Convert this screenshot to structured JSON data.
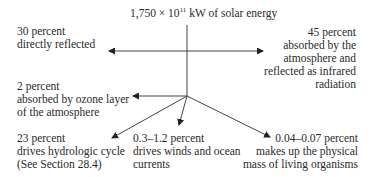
{
  "title": {
    "prefix": "1,750 × 10",
    "exponent": "11",
    "suffix": " kW of solar energy"
  },
  "labels": {
    "reflected": [
      "30 percent",
      "directly reflected"
    ],
    "absorbed_ir": [
      "45 percent",
      "absorbed by the",
      "atmosphere and",
      "reflected as infrared",
      "radiation"
    ],
    "ozone": [
      "2 percent",
      "absorbed by ozone layer",
      "of the atmosphere"
    ],
    "hydro": [
      "23 percent",
      "drives hydrologic cycle",
      "(See Section 28.4)"
    ],
    "winds": [
      "0.3–1.2 percent",
      "drives winds and ocean",
      "currents"
    ],
    "organisms": [
      "0.04–0.07 percent",
      "makes up the physical",
      "mass of living organisms"
    ]
  },
  "colors": {
    "text": "#2a2a2a",
    "line": "#333333"
  }
}
